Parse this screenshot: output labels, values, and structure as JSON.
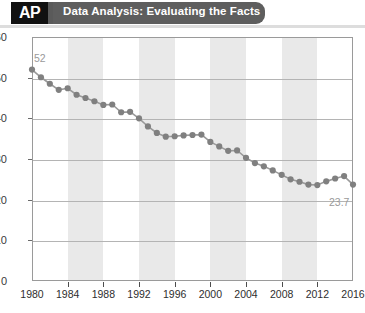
{
  "header": {
    "logo": "AP",
    "logo_icon": "ap-logo-icon",
    "title": "Data Analysis: Evaluating the Facts",
    "bar_color": "#5e5e5e",
    "logo_bg": "#111111"
  },
  "chart_data": {
    "type": "line",
    "title": "",
    "subtitle": "",
    "xlabel": "",
    "ylabel": "",
    "xlim": [
      1980,
      2016
    ],
    "ylim": [
      0,
      60
    ],
    "grid": true,
    "legend": false,
    "marker_color": "#808080",
    "line_color": "#9a9a9a",
    "band_color": "#e9e9e9",
    "shaded_bands": [
      [
        1984,
        1988
      ],
      [
        1992,
        1996
      ],
      [
        2000,
        2004
      ],
      [
        2008,
        2012
      ]
    ],
    "ytick_labels": [
      "60",
      "50",
      "40",
      "30",
      "20",
      "10",
      "0"
    ],
    "ytick_values": [
      60,
      50,
      40,
      30,
      20,
      10,
      0
    ],
    "xtick_labels": [
      "1980",
      "1984",
      "1988",
      "1992",
      "1996",
      "2000",
      "2004",
      "2008",
      "2012",
      "2016"
    ],
    "xtick_values": [
      1980,
      1984,
      1988,
      1992,
      1996,
      2000,
      2004,
      2008,
      2012,
      2016
    ],
    "x": [
      1980,
      1981,
      1982,
      1983,
      1984,
      1985,
      1986,
      1987,
      1988,
      1989,
      1990,
      1991,
      1992,
      1993,
      1994,
      1995,
      1996,
      1997,
      1998,
      1999,
      2000,
      2001,
      2002,
      2003,
      2004,
      2005,
      2006,
      2007,
      2008,
      2009,
      2010,
      2011,
      2012,
      2013,
      2014,
      2015,
      2016
    ],
    "values": [
      52.0,
      50.1,
      48.5,
      47.0,
      47.4,
      45.8,
      45.0,
      44.2,
      43.3,
      43.4,
      41.5,
      41.6,
      40.0,
      38.0,
      36.4,
      35.5,
      35.6,
      35.8,
      35.9,
      36.0,
      34.2,
      33.1,
      32.0,
      32.1,
      30.3,
      29.0,
      28.2,
      27.2,
      26.1,
      25.0,
      24.4,
      23.7,
      23.6,
      24.5,
      25.2,
      25.8,
      23.7
    ],
    "point_labels": [
      {
        "x": 1980,
        "value": 52,
        "text": "52"
      },
      {
        "x": 2016,
        "value": 23.7,
        "text": "23.7"
      }
    ]
  }
}
